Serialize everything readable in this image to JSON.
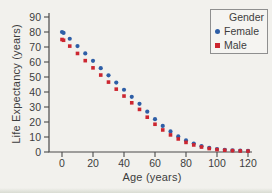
{
  "colors": {
    "background": "#f2f1ed",
    "axis": "#4a4a4a",
    "tick_text": "#3d3d3d",
    "female": "#2e5ea6",
    "male": "#cc2630",
    "legend_border": "#8f8f8f"
  },
  "chart_data": {
    "type": "scatter",
    "title": "",
    "xlabel": "Age (years)",
    "ylabel": "Life Expectancy (years)",
    "xlim": [
      0,
      120
    ],
    "ylim": [
      0,
      90
    ],
    "x_ticks": [
      0,
      20,
      40,
      60,
      80,
      100,
      120
    ],
    "y_ticks": [
      0,
      10,
      20,
      30,
      40,
      50,
      60,
      70,
      80,
      90
    ],
    "grid": false,
    "x": [
      0,
      1,
      5,
      10,
      15,
      20,
      25,
      30,
      35,
      40,
      45,
      50,
      55,
      60,
      65,
      70,
      75,
      80,
      85,
      90,
      95,
      100,
      105,
      110,
      115,
      120
    ],
    "series": [
      {
        "name": "Female",
        "marker": "circle",
        "color": "#2e5ea6",
        "values": [
          80,
          79.4,
          75.5,
          70.6,
          65.7,
          60.8,
          55.9,
          51.1,
          46.3,
          41.5,
          36.8,
          32.1,
          26.9,
          21.9,
          17.4,
          13.7,
          10.4,
          7.7,
          5.6,
          3.9,
          2.7,
          2.0,
          1.5,
          1.1,
          0.9,
          0.7
        ]
      },
      {
        "name": "Male",
        "marker": "square",
        "color": "#cc2630",
        "values": [
          75,
          74.5,
          70.6,
          65.7,
          60.9,
          56.1,
          51.3,
          46.6,
          41.9,
          37.3,
          32.8,
          28.4,
          23.2,
          18.5,
          14.7,
          11.4,
          8.7,
          6.4,
          4.7,
          3.3,
          2.3,
          1.6,
          1.2,
          0.9,
          0.7,
          0.6
        ]
      }
    ],
    "legend": {
      "title": "Gender",
      "position": "top-right"
    }
  }
}
